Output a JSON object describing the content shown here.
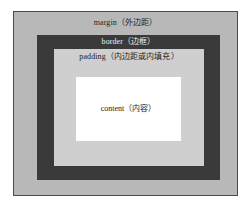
{
  "diagram": {
    "type": "css-box-model",
    "layers": [
      {
        "key": "margin",
        "label": "margin（外边距）",
        "color": "#b8b8b8",
        "text_color": "#1c1c1c"
      },
      {
        "key": "border",
        "label": "border（边框）",
        "color": "#3a3a3a",
        "text_color": "#ededed"
      },
      {
        "key": "padding",
        "label": "padding（内边距或内填充）",
        "color": "#cfcfcf",
        "text_color": "#1c1c1c"
      },
      {
        "key": "content",
        "label": "content（内容）",
        "color": "#ffffff",
        "text_color": "#1c1c1c"
      }
    ],
    "frame": {
      "border_color": "#4a4a4a",
      "background": "#ffffff"
    }
  }
}
